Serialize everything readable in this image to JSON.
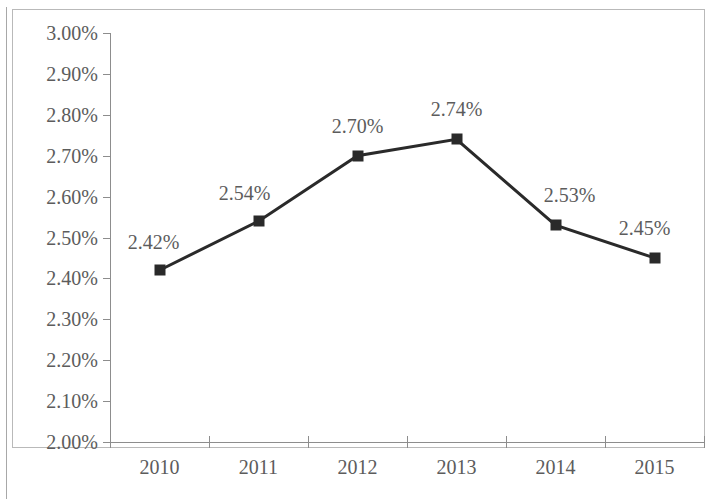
{
  "chart_data": {
    "type": "line",
    "title": "",
    "subtitle": "",
    "xlabel": "",
    "ylabel": "",
    "categories": [
      "2010",
      "2011",
      "2012",
      "2013",
      "2014",
      "2015"
    ],
    "values": [
      2.42,
      2.54,
      2.7,
      2.74,
      2.53,
      2.45
    ],
    "point_labels": [
      "2.42%",
      "2.54%",
      "2.70%",
      "2.74%",
      "2.53%",
      "2.45%"
    ],
    "series": [
      {
        "name": "",
        "values": [
          2.42,
          2.54,
          2.7,
          2.74,
          2.53,
          2.45
        ]
      }
    ],
    "ylim": [
      2.0,
      3.0
    ],
    "ytick_values": [
      3.0,
      2.9,
      2.8,
      2.7,
      2.6,
      2.5,
      2.4,
      2.3,
      2.2,
      2.1,
      2.0
    ],
    "ytick_labels": [
      "3.00%",
      "2.90%",
      "2.80%",
      "2.70%",
      "2.60%",
      "2.50%",
      "2.40%",
      "2.30%",
      "2.20%",
      "2.10%",
      "2.00%"
    ],
    "xtick_labels": [
      "2010",
      "2011",
      "2012",
      "2013",
      "2014",
      "2015"
    ],
    "grid": false,
    "legend": false,
    "legend_position": "none",
    "marker": "square",
    "marker_color": "#2a2a2a",
    "line_color": "#2a2a2a",
    "axis_color": "#8d8d8d",
    "text_color": "#5c5c5c",
    "background_color": "#ffffff",
    "data_label_positions": [
      "above-right",
      "above-left",
      "above",
      "above",
      "above-right",
      "above-left"
    ]
  },
  "axes": {
    "y": {
      "ticks": [
        {
          "label": "3.00%",
          "value": 3.0
        },
        {
          "label": "2.90%",
          "value": 2.9
        },
        {
          "label": "2.80%",
          "value": 2.8
        },
        {
          "label": "2.70%",
          "value": 2.7
        },
        {
          "label": "2.60%",
          "value": 2.6
        },
        {
          "label": "2.50%",
          "value": 2.5
        },
        {
          "label": "2.40%",
          "value": 2.4
        },
        {
          "label": "2.30%",
          "value": 2.3
        },
        {
          "label": "2.20%",
          "value": 2.2
        },
        {
          "label": "2.10%",
          "value": 2.1
        },
        {
          "label": "2.00%",
          "value": 2.0
        }
      ]
    },
    "x": {
      "ticks": [
        {
          "label": "2010"
        },
        {
          "label": "2011"
        },
        {
          "label": "2012"
        },
        {
          "label": "2013"
        },
        {
          "label": "2014"
        },
        {
          "label": "2015"
        }
      ]
    }
  },
  "points": [
    {
      "label": "2.42%",
      "category": "2010",
      "value": 2.42
    },
    {
      "label": "2.54%",
      "category": "2011",
      "value": 2.54
    },
    {
      "label": "2.70%",
      "category": "2012",
      "value": 2.7
    },
    {
      "label": "2.74%",
      "category": "2013",
      "value": 2.74
    },
    {
      "label": "2.53%",
      "category": "2014",
      "value": 2.53
    },
    {
      "label": "2.45%",
      "category": "2015",
      "value": 2.45
    }
  ]
}
